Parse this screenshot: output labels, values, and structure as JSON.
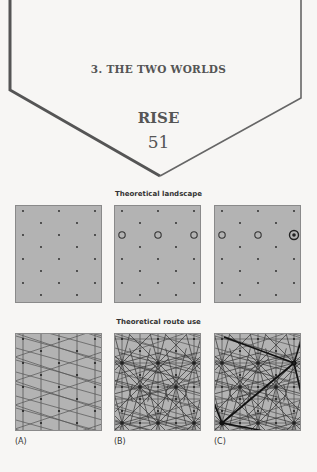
{
  "header": {
    "chapter": "3. THE TWO WORLDS",
    "section": "RISE",
    "page_number": "51"
  },
  "figure": {
    "top_caption": "Theoretical landscape",
    "bottom_caption": "Theoretical route use",
    "panel_labels": [
      "(A)",
      "(B)",
      "(C)"
    ],
    "colors": {
      "panel_fill": "#b3b3b3",
      "panel_border": "#8a8a8a",
      "dot": "#222222",
      "line": "#555555",
      "heavy_line": "#111111"
    },
    "landscape": {
      "A": {
        "settlement_tiers": 1,
        "description": "uniform triangular lattice of small dots"
      },
      "B": {
        "settlement_tiers": 2,
        "description": "lattice with larger centres shown as open circles"
      },
      "C": {
        "settlement_tiers": 3,
        "description": "lattice with open circles plus two largest centres as circled dots (top-right, bottom-left)"
      }
    },
    "route_use": {
      "A": {
        "description": "uniform triangular network of equal-weight routes"
      },
      "B": {
        "description": "routes radiating from open-circle centres"
      },
      "C": {
        "description": "heavy routes connecting the two largest centres"
      }
    }
  }
}
